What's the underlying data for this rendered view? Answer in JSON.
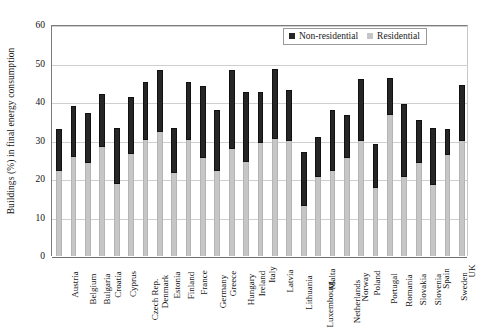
{
  "chart_data": {
    "type": "bar",
    "stacked": true,
    "title": "",
    "xlabel": "",
    "ylabel": "Buildings (%) in final energy consumption",
    "ylim": [
      0,
      60
    ],
    "ytick_values": [
      0,
      10,
      20,
      30,
      40,
      50,
      60
    ],
    "ytick_labels": [
      "0",
      "10",
      "20",
      "30",
      "40",
      "50",
      "60"
    ],
    "grid": true,
    "legend_position": "top-right",
    "categories": [
      "Austria",
      "Belgium",
      "Bulgaria",
      "Croatia",
      "Cyprus",
      "Czech Rep.",
      "Denmark",
      "Estonia",
      "Finland",
      "France",
      "Germany",
      "Greece",
      "Hungary",
      "Ireland",
      "Italy",
      "Latvia",
      "Lithuania",
      "Luxembourg",
      "Malta",
      "Netherlands",
      "Norway",
      "Poland",
      "Portugal",
      "Romania",
      "Slovakia",
      "Slovenia",
      "Spain",
      "Sweden",
      "UK"
    ],
    "series": [
      {
        "name": "Residential",
        "color": "#c6c6c6",
        "values": [
          22.0,
          25.7,
          24.2,
          28.2,
          18.7,
          26.5,
          30.1,
          32.2,
          21.5,
          30.2,
          25.5,
          22.2,
          27.7,
          24.5,
          29.3,
          30.3,
          30.0,
          13.0,
          20.5,
          22.2,
          25.5,
          30.0,
          17.7,
          36.5,
          20.5,
          24.2,
          18.5,
          26.2,
          29.8
        ]
      },
      {
        "name": "Non-residential",
        "color": "#262626",
        "values": [
          11.0,
          13.3,
          13.0,
          13.8,
          14.5,
          14.8,
          15.1,
          16.1,
          11.8,
          15.0,
          18.7,
          15.8,
          20.7,
          18.1,
          13.2,
          18.3,
          13.0,
          14.0,
          10.3,
          15.6,
          11.0,
          15.9,
          11.3,
          9.8,
          18.9,
          11.1,
          14.8,
          6.9,
          14.5
        ]
      }
    ],
    "totals": [
      33.0,
      39.0,
      37.2,
      42.0,
      33.2,
      41.3,
      45.2,
      48.3,
      33.3,
      45.2,
      44.2,
      38.0,
      48.4,
      42.6,
      42.5,
      48.6,
      43.0,
      27.0,
      30.8,
      37.8,
      36.5,
      45.9,
      29.0,
      46.3,
      39.4,
      35.3,
      33.3,
      33.1,
      44.3
    ]
  },
  "legend": {
    "items": [
      {
        "label": "Non-residential"
      },
      {
        "label": "Residential"
      }
    ]
  },
  "axes": {
    "y_title": "Buildings (%) in final energy consumption"
  }
}
